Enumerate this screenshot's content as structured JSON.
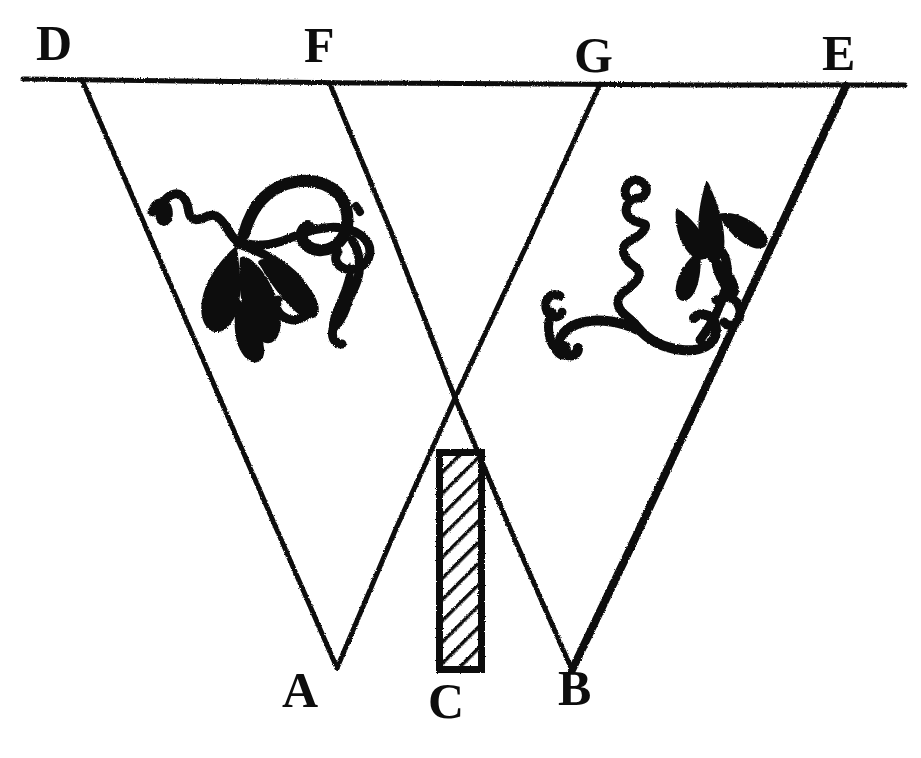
{
  "figure": {
    "background_color": "#ffffff",
    "ink_color": "#0d0d0d",
    "width": 921,
    "height": 758,
    "labels": [
      {
        "id": "D",
        "text": "D",
        "x": 36,
        "y": 18,
        "position": "top-left"
      },
      {
        "id": "F",
        "text": "F",
        "x": 304,
        "y": 20,
        "position": "top-center-left"
      },
      {
        "id": "G",
        "text": "G",
        "x": 574,
        "y": 30,
        "position": "top-center-right"
      },
      {
        "id": "E",
        "text": "E",
        "x": 822,
        "y": 28,
        "position": "top-right"
      },
      {
        "id": "A",
        "text": "A",
        "x": 282,
        "y": 665,
        "position": "bottom-left"
      },
      {
        "id": "C",
        "text": "C",
        "x": 428,
        "y": 676,
        "position": "bottom-center"
      },
      {
        "id": "B",
        "text": "B",
        "x": 558,
        "y": 663,
        "position": "bottom-right"
      }
    ],
    "baseline": {
      "name": "horizontal-line-DE",
      "x1": 23,
      "y1": 79,
      "x2": 905,
      "y2": 85,
      "stroke_width": 5
    },
    "rays": [
      {
        "name": "ray-D-to-A",
        "from": "D",
        "to": "A",
        "x1": 82,
        "y1": 80,
        "x2": 337,
        "y2": 668,
        "stroke_width": 5
      },
      {
        "name": "ray-F-to-B",
        "from": "F",
        "to": "B",
        "x1": 330,
        "y1": 84,
        "x2": 572,
        "y2": 670,
        "stroke_width": 5
      },
      {
        "name": "ray-G-to-A",
        "from": "G",
        "to": "A",
        "x1": 600,
        "y1": 84,
        "x2": 337,
        "y2": 668,
        "stroke_width": 5
      },
      {
        "name": "ray-E-to-B",
        "from": "E",
        "to": "B",
        "x1": 846,
        "y1": 86,
        "x2": 572,
        "y2": 670,
        "stroke_width": 8
      }
    ],
    "intersection": {
      "name": "rays-crossing-point",
      "x": 455,
      "y": 399
    },
    "obstacle": {
      "name": "hatched-rectangle-C",
      "label": "C",
      "x": 436,
      "y": 449,
      "width": 49,
      "height": 224,
      "fill_pattern": "diagonal-hatch",
      "border_width": 7
    },
    "ornaments": [
      {
        "name": "left-floral-ornament",
        "x": 148,
        "y": 172,
        "width": 238,
        "height": 176
      },
      {
        "name": "right-floral-ornament",
        "x": 546,
        "y": 168,
        "width": 218,
        "height": 188
      }
    ]
  }
}
